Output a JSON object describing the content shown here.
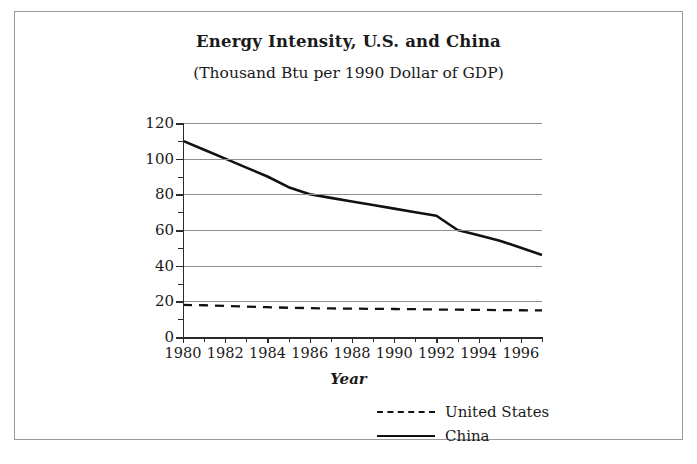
{
  "chart_data": {
    "type": "line",
    "title": "Energy Intensity, U.S. and China",
    "subtitle": "(Thousand Btu per 1990 Dollar of GDP)",
    "xlabel": "Year",
    "ylabel": "",
    "xlim": [
      1980,
      1997
    ],
    "ylim": [
      0,
      120
    ],
    "ytick_step": 20,
    "yminor_step": 10,
    "xtick_step": 1,
    "xlabel_step": 2,
    "grid": "horizontal",
    "legend_position": "bottom-right",
    "x": [
      1980,
      1981,
      1982,
      1983,
      1984,
      1985,
      1986,
      1987,
      1988,
      1989,
      1990,
      1991,
      1992,
      1993,
      1994,
      1995,
      1996,
      1997
    ],
    "yticks": [
      0,
      20,
      40,
      60,
      80,
      100,
      120
    ],
    "ytick_labels": [
      "0",
      "20",
      "40",
      "60",
      "80",
      "100",
      "120"
    ],
    "xticks": [
      1980,
      1981,
      1982,
      1983,
      1984,
      1985,
      1986,
      1987,
      1988,
      1989,
      1990,
      1991,
      1992,
      1993,
      1994,
      1995,
      1996,
      1997
    ],
    "xtick_labels": [
      "1980",
      "",
      "1982",
      "",
      "1984",
      "",
      "1986",
      "",
      "1988",
      "",
      "1990",
      "",
      "1992",
      "",
      "1994",
      "",
      "1996",
      ""
    ],
    "series": [
      {
        "name": "United States",
        "style": "dashed",
        "color": "#111111",
        "values": [
          18,
          17.8,
          17.4,
          17.0,
          16.7,
          16.4,
          16.2,
          16.0,
          15.9,
          15.8,
          15.7,
          15.6,
          15.4,
          15.3,
          15.2,
          15.1,
          15.0,
          14.9
        ]
      },
      {
        "name": "China",
        "style": "solid",
        "color": "#111111",
        "values": [
          110,
          105,
          100,
          95,
          90,
          84,
          80,
          78,
          76,
          74,
          72,
          70,
          68,
          60,
          57,
          54,
          50,
          46
        ]
      }
    ]
  },
  "legend": {
    "items": [
      {
        "label": "United States",
        "style": "dashed"
      },
      {
        "label": "China",
        "style": "solid"
      }
    ]
  }
}
